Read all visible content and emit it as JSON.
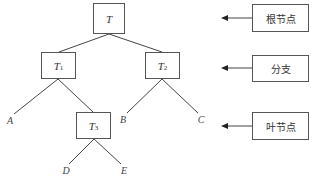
{
  "tree": {
    "root": {
      "id": "T",
      "label": "T",
      "subscript": ""
    },
    "internal": [
      {
        "id": "T1",
        "label": "T",
        "subscript": "1"
      },
      {
        "id": "T2",
        "label": "T",
        "subscript": "2"
      },
      {
        "id": "T3",
        "label": "T",
        "subscript": "3"
      }
    ],
    "leaves": [
      {
        "id": "A",
        "label": "A"
      },
      {
        "id": "B",
        "label": "B"
      },
      {
        "id": "C",
        "label": "C"
      },
      {
        "id": "D",
        "label": "D"
      },
      {
        "id": "E",
        "label": "E"
      }
    ],
    "edges": [
      [
        "T",
        "T1"
      ],
      [
        "T",
        "T2"
      ],
      [
        "T1",
        "A"
      ],
      [
        "T1",
        "T3"
      ],
      [
        "T2",
        "B"
      ],
      [
        "T2",
        "C"
      ],
      [
        "T3",
        "D"
      ],
      [
        "T3",
        "E"
      ]
    ]
  },
  "legend": [
    {
      "label": "根节点",
      "meaning": "root node"
    },
    {
      "label": "分支",
      "meaning": "branch"
    },
    {
      "label": "叶节点",
      "meaning": "leaf node"
    }
  ],
  "colors": {
    "stroke": "#444444",
    "background": "#ffffff",
    "text": "#333333"
  }
}
